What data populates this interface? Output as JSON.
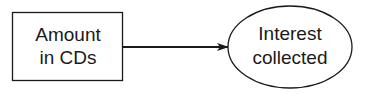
{
  "diagram": {
    "nodes": [
      {
        "id": "amount",
        "shape": "rectangle",
        "lines": [
          "Amount",
          "in CDs"
        ]
      },
      {
        "id": "interest",
        "shape": "ellipse",
        "lines": [
          "Interest",
          "collected"
        ]
      }
    ],
    "edges": [
      {
        "from": "amount",
        "to": "interest",
        "style": "arrow"
      }
    ],
    "colors": {
      "stroke": "#1a1a1a",
      "background": "#ffffff"
    }
  }
}
